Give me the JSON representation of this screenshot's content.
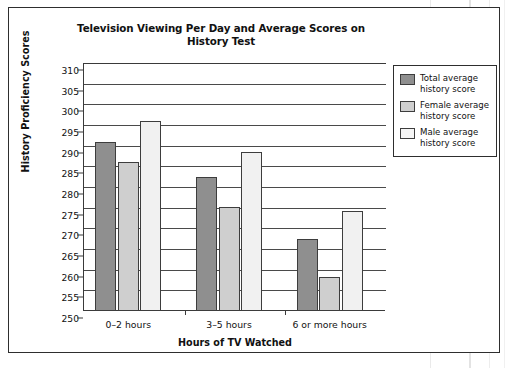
{
  "chart_data": {
    "type": "bar",
    "title": "Television Viewing Per Day and Average Scores on History Test",
    "title_line1": "Television Viewing Per Day and Average Scores on",
    "title_line2": "History Test",
    "xlabel": "Hours of TV Watched",
    "ylabel": "History Proficiency Scores",
    "categories": [
      "0–2 hours",
      "3–5 hours",
      "6 or more hours"
    ],
    "series": [
      {
        "name": "Total average history score",
        "values": [
          291.0,
          282.5,
          267.5
        ],
        "color": "#8f8f8f"
      },
      {
        "name": "Female average history score",
        "values": [
          286.0,
          275.2,
          258.3
        ],
        "color": "#cfcfcf"
      },
      {
        "name": "Male average history score",
        "values": [
          296.0,
          288.4,
          274.3
        ],
        "color": "#f1f1f1"
      }
    ],
    "ylim": [
      250,
      310
    ],
    "ytick_step": 5,
    "yticks": [
      310,
      305,
      300,
      295,
      290,
      285,
      280,
      275,
      270,
      265,
      260,
      255,
      250
    ],
    "ytick_labels": [
      "310",
      "305",
      "300",
      "295",
      "290",
      "285",
      "280",
      "275",
      "270",
      "265",
      "260",
      "255",
      "250"
    ],
    "grid": true,
    "grid_axis": "y",
    "legend_position": "right-outside",
    "legend": [
      {
        "label_line1": "Total average",
        "label_line2": "history score",
        "color": "#8f8f8f"
      },
      {
        "label_line1": "Female average",
        "label_line2": "history score",
        "color": "#cfcfcf"
      },
      {
        "label_line1": "Male average",
        "label_line2": "history score",
        "color": "#f5f5f5"
      }
    ]
  }
}
